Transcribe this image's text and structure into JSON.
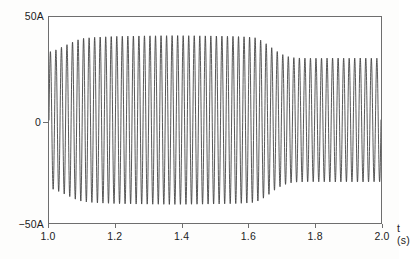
{
  "figure": {
    "background_color": "#fdfdfc",
    "plot_background_color": "#ffffff",
    "frame_color": "#6e6e6e",
    "trace_color": "#3a3a3a"
  },
  "axis": {
    "x_title": "t (s)",
    "y_labels": {
      "top": "50A",
      "zero": "0",
      "bottom": "−50A"
    },
    "x_tick_labels": [
      "1.0",
      "1.2",
      "1.4",
      "1.6",
      "1.8",
      "2.0"
    ]
  },
  "chart_data": {
    "type": "line",
    "title": "",
    "subtitle": "",
    "xlabel": "t (s)",
    "ylabel": "",
    "xlim": [
      1.0,
      2.0
    ],
    "ylim": [
      -50,
      50
    ],
    "x_ticks": [
      1.0,
      1.2,
      1.4,
      1.6,
      1.8,
      2.0
    ],
    "x_tick_labels": [
      "1.0",
      "1.2",
      "1.4",
      "1.6",
      "1.8",
      "2.0"
    ],
    "y_ticks": [
      -50,
      0,
      50
    ],
    "y_tick_labels": [
      "−50A",
      "0",
      "50A"
    ],
    "grid": false,
    "legend": null,
    "units": "A",
    "series": [
      {
        "name": "current",
        "waveform": "sine",
        "frequency_hz": 60,
        "phase_rad": 0,
        "samples_per_second": 4000,
        "envelope": {
          "x": [
            1.0,
            1.02,
            1.04,
            1.06,
            1.08,
            1.1,
            1.14,
            1.2,
            1.26,
            1.32,
            1.38,
            1.44,
            1.5,
            1.56,
            1.6,
            1.62,
            1.64,
            1.66,
            1.68,
            1.7,
            1.72,
            1.74,
            1.78,
            1.82,
            1.86,
            1.9,
            1.94,
            1.98,
            2.0
          ],
          "amplitude": [
            33.0,
            34.0,
            35.5,
            37.0,
            38.5,
            39.6,
            40.2,
            40.6,
            40.8,
            40.9,
            41.0,
            40.9,
            40.8,
            40.6,
            40.3,
            40.0,
            38.6,
            36.4,
            34.0,
            32.0,
            30.8,
            30.2,
            30.0,
            30.0,
            30.1,
            30.0,
            30.1,
            30.0,
            30.0
          ]
        }
      }
    ]
  }
}
